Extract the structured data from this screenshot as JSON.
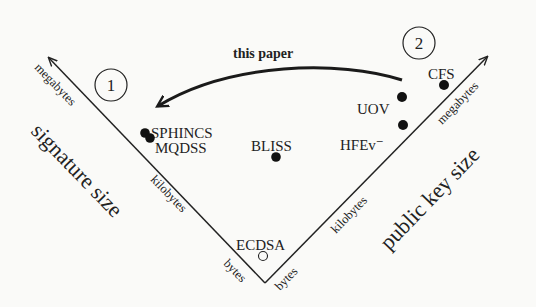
{
  "diagram": {
    "type": "v-shaped-tradeoff-plot",
    "left_axis": {
      "title": "signature size",
      "ticks": [
        "bytes",
        "kilobytes",
        "megabytes"
      ]
    },
    "right_axis": {
      "title": "public key size",
      "ticks": [
        "bytes",
        "kilobytes",
        "megabytes"
      ]
    },
    "regions": [
      {
        "id": "region-1",
        "label": "1"
      },
      {
        "id": "region-2",
        "label": "2"
      }
    ],
    "arrow": {
      "label": "this paper",
      "from": "region-2",
      "to": "region-1"
    },
    "schemes": [
      {
        "name": "SPHINCS",
        "marker": "filled",
        "signature_size": "large",
        "public_key_size": "small"
      },
      {
        "name": "MQDSS",
        "marker": "filled",
        "signature_size": "large",
        "public_key_size": "small"
      },
      {
        "name": "BLISS",
        "marker": "filled",
        "signature_size": "kilobytes",
        "public_key_size": "kilobytes"
      },
      {
        "name": "ECDSA",
        "marker": "open",
        "signature_size": "bytes",
        "public_key_size": "bytes"
      },
      {
        "name": "UOV",
        "marker": "filled",
        "signature_size": "small",
        "public_key_size": "large"
      },
      {
        "name": "HFEv⁻",
        "marker": "filled",
        "signature_size": "small",
        "public_key_size": "large"
      },
      {
        "name": "CFS",
        "marker": "filled",
        "signature_size": "small",
        "public_key_size": "megabytes"
      }
    ]
  }
}
